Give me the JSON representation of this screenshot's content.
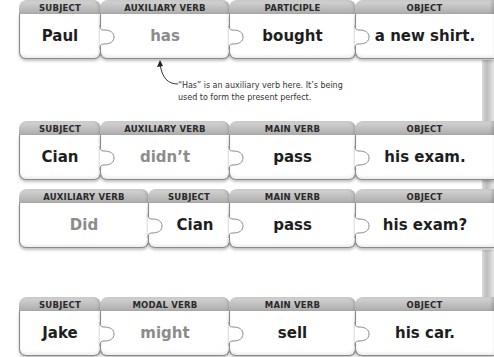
{
  "rows": [
    {
      "pieces": [
        {
          "label": "SUBJECT",
          "word": "Paul",
          "tone": "strong"
        },
        {
          "label": "AUXILIARY VERB",
          "word": "has",
          "tone": "soft"
        },
        {
          "label": "PARTICIPLE",
          "word": "bought",
          "tone": "strong"
        },
        {
          "label": "OBJECT",
          "word": "a new shirt.",
          "tone": "strong"
        }
      ]
    },
    {
      "pieces": [
        {
          "label": "SUBJECT",
          "word": "Cian",
          "tone": "strong"
        },
        {
          "label": "AUXILIARY VERB",
          "word": "didn’t",
          "tone": "soft"
        },
        {
          "label": "MAIN VERB",
          "word": "pass",
          "tone": "strong"
        },
        {
          "label": "OBJECT",
          "word": "his exam.",
          "tone": "strong"
        }
      ]
    },
    {
      "pieces": [
        {
          "label": "AUXILIARY VERB",
          "word": "Did",
          "tone": "soft"
        },
        {
          "label": "SUBJECT",
          "word": "Cian",
          "tone": "strong"
        },
        {
          "label": "MAIN VERB",
          "word": "pass",
          "tone": "strong"
        },
        {
          "label": "OBJECT",
          "word": "his exam?",
          "tone": "strong"
        }
      ]
    },
    {
      "pieces": [
        {
          "label": "SUBJECT",
          "word": "Jake",
          "tone": "strong"
        },
        {
          "label": "MODAL VERB",
          "word": "might",
          "tone": "soft"
        },
        {
          "label": "MAIN VERB",
          "word": "sell",
          "tone": "strong"
        },
        {
          "label": "OBJECT",
          "word": "his car.",
          "tone": "strong"
        }
      ]
    }
  ],
  "annotation": {
    "line1": "“Has” is an auxiliary verb here. It’s being",
    "line2": "used to form the present perfect."
  },
  "colors": {
    "strong_text": "#1e1e1e",
    "soft_text": "#8c8c8c",
    "tab_gray": "#b5b5b5"
  }
}
